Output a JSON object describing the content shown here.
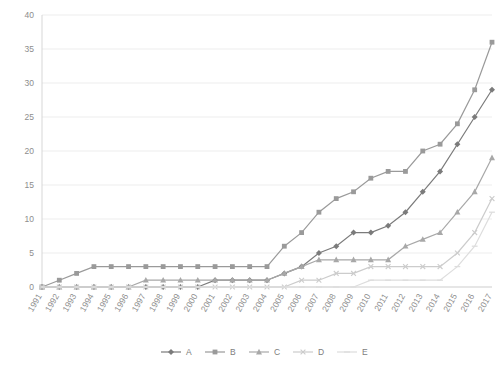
{
  "chart_data": {
    "type": "line",
    "title": "",
    "xlabel": "",
    "ylabel": "",
    "ylim": [
      0,
      40
    ],
    "ytick_step": 5,
    "grid": true,
    "legend_position": "bottom",
    "categories": [
      "1991",
      "1992",
      "1993",
      "1994",
      "1995",
      "1996",
      "1997",
      "1998",
      "1999",
      "2000",
      "2001",
      "2002",
      "2003",
      "2004",
      "2005",
      "2006",
      "2007",
      "2008",
      "2009",
      "2010",
      "2011",
      "2012",
      "2013",
      "2014",
      "2015",
      "2016",
      "2017"
    ],
    "yticks": [
      "0",
      "5",
      "10",
      "15",
      "20",
      "25",
      "30",
      "35",
      "40"
    ],
    "series": [
      {
        "name": "A",
        "marker": "diamond",
        "color": "#7b7b7b",
        "values": [
          0,
          0,
          0,
          0,
          0,
          0,
          0,
          0,
          0,
          0,
          1,
          1,
          1,
          1,
          2,
          3,
          5,
          6,
          8,
          8,
          9,
          11,
          14,
          17,
          21,
          25,
          29
        ]
      },
      {
        "name": "B",
        "marker": "square",
        "color": "#9a9a9a",
        "values": [
          0,
          1,
          2,
          3,
          3,
          3,
          3,
          3,
          3,
          3,
          3,
          3,
          3,
          3,
          6,
          8,
          11,
          13,
          14,
          16,
          17,
          17,
          20,
          21,
          24,
          29,
          36
        ]
      },
      {
        "name": "C",
        "marker": "triangle",
        "color": "#a8a8a8",
        "values": [
          0,
          0,
          0,
          0,
          0,
          0,
          1,
          1,
          1,
          1,
          1,
          1,
          1,
          1,
          2,
          3,
          4,
          4,
          4,
          4,
          4,
          6,
          7,
          8,
          11,
          14,
          19
        ]
      },
      {
        "name": "D",
        "marker": "cross",
        "color": "#cccccc",
        "values": [
          0,
          0,
          0,
          0,
          0,
          0,
          0,
          0,
          0,
          0,
          0,
          0,
          0,
          0,
          0,
          1,
          1,
          2,
          2,
          3,
          3,
          3,
          3,
          3,
          5,
          8,
          13
        ]
      },
      {
        "name": "E",
        "marker": "dash",
        "color": "#dddddd",
        "values": [
          0,
          0,
          0,
          0,
          0,
          0,
          0,
          0,
          0,
          0,
          0,
          0,
          0,
          0,
          0,
          0,
          0,
          0,
          0,
          1,
          1,
          1,
          1,
          1,
          3,
          6,
          11
        ]
      }
    ]
  },
  "legend": {
    "items": [
      {
        "label": "A"
      },
      {
        "label": "B"
      },
      {
        "label": "C"
      },
      {
        "label": "D"
      },
      {
        "label": "E"
      }
    ]
  },
  "colors": {
    "gridline": "#e8e8e8",
    "axis": "#d2d2d2",
    "tick_text": "#8d8d8d",
    "background": "#ffffff"
  }
}
